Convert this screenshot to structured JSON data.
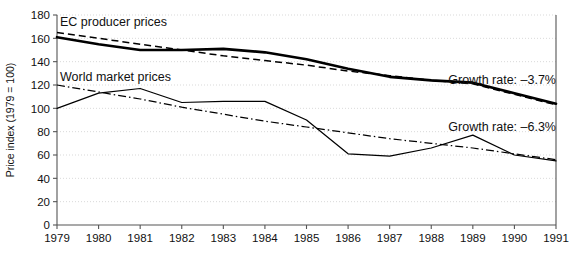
{
  "chart_data": {
    "type": "line",
    "title": "",
    "xlabel": "",
    "ylabel": "Price index (1979 = 100)",
    "xlim": [
      1979,
      1991
    ],
    "ylim": [
      0,
      180
    ],
    "grid": true,
    "legend_position": "inline-annotations",
    "x": [
      1979,
      1980,
      1981,
      1982,
      1983,
      1984,
      1985,
      1986,
      1987,
      1988,
      1989,
      1990,
      1991
    ],
    "xticklabels": [
      "1979",
      "1980",
      "1981",
      "1982",
      "1983",
      "1984",
      "1985",
      "1986",
      "1987",
      "1988",
      "1989",
      "1990",
      "1991"
    ],
    "yticks": [
      0,
      20,
      40,
      60,
      80,
      100,
      120,
      140,
      160,
      180
    ],
    "yticklabels": [
      "0",
      "20",
      "40",
      "60",
      "80",
      "100",
      "120",
      "140",
      "160",
      "180"
    ],
    "series": [
      {
        "name": "EC producer prices",
        "style": "solid-thick",
        "values": [
          161,
          155,
          150,
          150,
          151,
          148,
          142,
          134,
          127,
          124,
          122,
          113,
          104
        ]
      },
      {
        "name": "EC producer prices trend",
        "style": "dashed",
        "values": [
          165,
          160,
          155,
          150,
          145,
          141,
          137,
          132,
          128,
          124,
          121,
          112,
          103
        ]
      },
      {
        "name": "World market prices",
        "style": "solid-thin",
        "values": [
          100,
          113,
          117,
          105,
          106,
          106,
          90,
          61,
          59,
          66,
          77,
          60,
          55
        ]
      },
      {
        "name": "World market prices trend",
        "style": "dash-dot",
        "values": [
          120,
          114,
          108,
          101,
          95,
          89,
          84,
          79,
          74,
          70,
          66,
          61,
          56
        ]
      }
    ],
    "annotations": [
      {
        "id": "ec-producer-prices",
        "text": "EC producer prices",
        "x_px": 60,
        "y_px": 26
      },
      {
        "id": "world-market-prices",
        "text": "World market prices",
        "x_px": 60,
        "y_px": 81
      },
      {
        "id": "growth-rate-ec",
        "text": "Growth rate: –3.7%",
        "x_px": 556,
        "y_px": 84
      },
      {
        "id": "growth-rate-world",
        "text": "Growth rate: –6.3%",
        "x_px": 556,
        "y_px": 131
      }
    ],
    "colors": {
      "line": "#000000",
      "grid": "#cfcfcf",
      "axis": "#555555",
      "text": "#111111",
      "background": "#ffffff"
    }
  }
}
